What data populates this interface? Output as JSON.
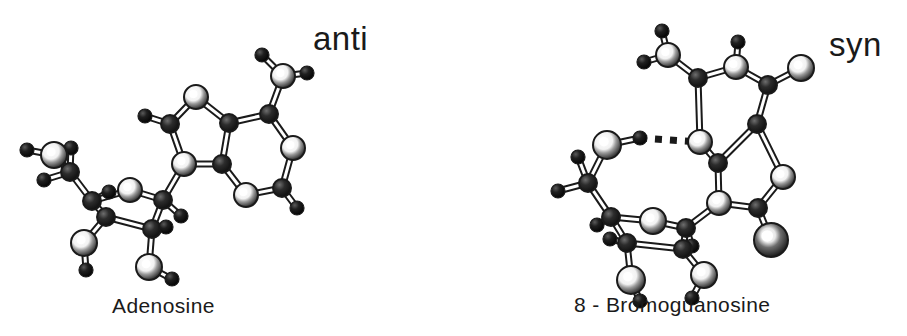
{
  "figure": {
    "background_color": "#ffffff",
    "ink_color": "#1a1a1a",
    "width": 907,
    "height": 336,
    "caption_font_size": 21,
    "label_font_size": 33
  },
  "panels": [
    {
      "id": "left-panel",
      "molecule_name": "Adenosine",
      "conformation_label": "anti",
      "has_hydrogen_bond": false
    },
    {
      "id": "right-panel",
      "molecule_name": "8 - Bromoguanosine",
      "conformation_label": "syn",
      "has_hydrogen_bond": true
    }
  ],
  "structures": {
    "adenosine": {
      "atoms": [
        {
          "id": "N6H_a",
          "x": 262,
          "y": 55,
          "r": 7,
          "type": "small"
        },
        {
          "id": "N6",
          "x": 283,
          "y": 76,
          "r": 12,
          "type": "large"
        },
        {
          "id": "N6H_b",
          "x": 307,
          "y": 73,
          "r": 7,
          "type": "small"
        },
        {
          "id": "C6",
          "x": 269,
          "y": 114,
          "r": 9,
          "type": "medium"
        },
        {
          "id": "N1",
          "x": 293,
          "y": 148,
          "r": 12,
          "type": "large"
        },
        {
          "id": "C2",
          "x": 282,
          "y": 188,
          "r": 9,
          "type": "medium"
        },
        {
          "id": "C2H",
          "x": 297,
          "y": 208,
          "r": 7,
          "type": "small"
        },
        {
          "id": "N3",
          "x": 246,
          "y": 195,
          "r": 12,
          "type": "large"
        },
        {
          "id": "C4",
          "x": 222,
          "y": 164,
          "r": 9,
          "type": "medium"
        },
        {
          "id": "C5",
          "x": 229,
          "y": 123,
          "r": 9,
          "type": "medium"
        },
        {
          "id": "N7",
          "x": 196,
          "y": 97,
          "r": 12,
          "type": "large"
        },
        {
          "id": "C8",
          "x": 170,
          "y": 124,
          "r": 9,
          "type": "medium"
        },
        {
          "id": "C8H",
          "x": 145,
          "y": 116,
          "r": 7,
          "type": "small"
        },
        {
          "id": "N9",
          "x": 184,
          "y": 164,
          "r": 12,
          "type": "large"
        },
        {
          "id": "C1p",
          "x": 163,
          "y": 200,
          "r": 9,
          "type": "medium"
        },
        {
          "id": "C1pH",
          "x": 181,
          "y": 216,
          "r": 7,
          "type": "small"
        },
        {
          "id": "O4p",
          "x": 130,
          "y": 190,
          "r": 12,
          "type": "large"
        },
        {
          "id": "C2p",
          "x": 152,
          "y": 229,
          "r": 9,
          "type": "medium"
        },
        {
          "id": "C2pH",
          "x": 166,
          "y": 227,
          "r": 7,
          "type": "small"
        },
        {
          "id": "O2p",
          "x": 149,
          "y": 267,
          "r": 13,
          "type": "large"
        },
        {
          "id": "HO2p",
          "x": 172,
          "y": 279,
          "r": 7,
          "type": "small"
        },
        {
          "id": "C3p",
          "x": 106,
          "y": 217,
          "r": 9,
          "type": "medium"
        },
        {
          "id": "O3p",
          "x": 84,
          "y": 243,
          "r": 13,
          "type": "large"
        },
        {
          "id": "HO3p",
          "x": 86,
          "y": 270,
          "r": 7,
          "type": "small"
        },
        {
          "id": "C4p",
          "x": 92,
          "y": 201,
          "r": 9,
          "type": "medium"
        },
        {
          "id": "C4pH",
          "x": 109,
          "y": 192,
          "r": 7,
          "type": "small"
        },
        {
          "id": "C5p",
          "x": 70,
          "y": 172,
          "r": 9,
          "type": "medium"
        },
        {
          "id": "C5pHa",
          "x": 71,
          "y": 148,
          "r": 7,
          "type": "small"
        },
        {
          "id": "C5pHb",
          "x": 44,
          "y": 180,
          "r": 7,
          "type": "small"
        },
        {
          "id": "O5p",
          "x": 54,
          "y": 155,
          "r": 13,
          "type": "large"
        },
        {
          "id": "HO5p",
          "x": 27,
          "y": 150,
          "r": 7,
          "type": "small"
        }
      ],
      "bonds": [
        [
          "N6H_a",
          "N6"
        ],
        [
          "N6",
          "N6H_b"
        ],
        [
          "N6",
          "C6"
        ],
        [
          "C6",
          "N1"
        ],
        [
          "N1",
          "C2"
        ],
        [
          "C2",
          "C2H"
        ],
        [
          "C2",
          "N3"
        ],
        [
          "N3",
          "C4"
        ],
        [
          "C4",
          "C5"
        ],
        [
          "C5",
          "C6"
        ],
        [
          "C5",
          "N7"
        ],
        [
          "N7",
          "C8"
        ],
        [
          "C8",
          "C8H"
        ],
        [
          "C8",
          "N9"
        ],
        [
          "N9",
          "C4"
        ],
        [
          "N9",
          "C1p"
        ],
        [
          "C1p",
          "C1pH"
        ],
        [
          "C1p",
          "O4p"
        ],
        [
          "C1p",
          "C2p"
        ],
        [
          "C2p",
          "C2pH"
        ],
        [
          "C2p",
          "O2p"
        ],
        [
          "O2p",
          "HO2p"
        ],
        [
          "C2p",
          "C3p"
        ],
        [
          "C3p",
          "O3p"
        ],
        [
          "O3p",
          "HO3p"
        ],
        [
          "C3p",
          "C4p"
        ],
        [
          "C4p",
          "C4pH"
        ],
        [
          "C4p",
          "O4p"
        ],
        [
          "C4p",
          "C5p"
        ],
        [
          "C5p",
          "C5pHa"
        ],
        [
          "C5p",
          "C5pHb"
        ],
        [
          "C5p",
          "O5p"
        ],
        [
          "O5p",
          "HO5p"
        ]
      ]
    },
    "bromoguanosine": {
      "atoms": [
        {
          "id": "O6",
          "x": 662,
          "y": 31,
          "r": 7,
          "type": "small"
        },
        {
          "id": "C6",
          "x": 668,
          "y": 55,
          "r": 12,
          "type": "large"
        },
        {
          "id": "N1H",
          "x": 644,
          "y": 62,
          "r": 7,
          "type": "small"
        },
        {
          "id": "N1",
          "x": 698,
          "y": 78,
          "r": 9,
          "type": "medium"
        },
        {
          "id": "C2",
          "x": 736,
          "y": 67,
          "r": 12,
          "type": "large"
        },
        {
          "id": "N2H",
          "x": 738,
          "y": 42,
          "r": 7,
          "type": "small"
        },
        {
          "id": "N2",
          "x": 768,
          "y": 85,
          "r": 9,
          "type": "medium"
        },
        {
          "id": "NH2",
          "x": 801,
          "y": 68,
          "r": 13,
          "type": "large"
        },
        {
          "id": "C5",
          "x": 757,
          "y": 124,
          "r": 9,
          "type": "medium"
        },
        {
          "id": "N3",
          "x": 700,
          "y": 142,
          "r": 12,
          "type": "large"
        },
        {
          "id": "C4",
          "x": 718,
          "y": 163,
          "r": 9,
          "type": "medium"
        },
        {
          "id": "N7",
          "x": 783,
          "y": 177,
          "r": 12,
          "type": "large"
        },
        {
          "id": "C8",
          "x": 758,
          "y": 208,
          "r": 9,
          "type": "medium"
        },
        {
          "id": "Br",
          "x": 771,
          "y": 240,
          "r": 17,
          "type": "xlarge"
        },
        {
          "id": "N9",
          "x": 719,
          "y": 203,
          "r": 12,
          "type": "large"
        },
        {
          "id": "C1p",
          "x": 686,
          "y": 228,
          "r": 9,
          "type": "medium"
        },
        {
          "id": "C1pH",
          "x": 692,
          "y": 246,
          "r": 7,
          "type": "small"
        },
        {
          "id": "O4p",
          "x": 653,
          "y": 221,
          "r": 13,
          "type": "large"
        },
        {
          "id": "C2p",
          "x": 683,
          "y": 249,
          "r": 9,
          "type": "medium"
        },
        {
          "id": "O2p",
          "x": 704,
          "y": 275,
          "r": 13,
          "type": "large"
        },
        {
          "id": "HO2p",
          "x": 692,
          "y": 298,
          "r": 7,
          "type": "small"
        },
        {
          "id": "C3p",
          "x": 627,
          "y": 243,
          "r": 9,
          "type": "medium"
        },
        {
          "id": "C3pH",
          "x": 610,
          "y": 239,
          "r": 7,
          "type": "small"
        },
        {
          "id": "O3p",
          "x": 631,
          "y": 280,
          "r": 14,
          "type": "large"
        },
        {
          "id": "HO3p",
          "x": 640,
          "y": 301,
          "r": 7,
          "type": "small"
        },
        {
          "id": "C4p",
          "x": 611,
          "y": 217,
          "r": 9,
          "type": "medium"
        },
        {
          "id": "C4pH",
          "x": 597,
          "y": 225,
          "r": 7,
          "type": "small"
        },
        {
          "id": "C5p",
          "x": 588,
          "y": 183,
          "r": 9,
          "type": "medium"
        },
        {
          "id": "C5pHa",
          "x": 578,
          "y": 157,
          "r": 7,
          "type": "small"
        },
        {
          "id": "C5pHb",
          "x": 558,
          "y": 191,
          "r": 7,
          "type": "small"
        },
        {
          "id": "O5p",
          "x": 607,
          "y": 145,
          "r": 14,
          "type": "large"
        },
        {
          "id": "HO5p",
          "x": 640,
          "y": 138,
          "r": 7,
          "type": "small"
        }
      ],
      "bonds": [
        [
          "O6",
          "C6"
        ],
        [
          "C6",
          "N1H"
        ],
        [
          "C6",
          "N1"
        ],
        [
          "N1",
          "C2"
        ],
        [
          "C2",
          "N2H"
        ],
        [
          "C2",
          "N2"
        ],
        [
          "N2",
          "NH2"
        ],
        [
          "N2",
          "C5"
        ],
        [
          "C5",
          "C4"
        ],
        [
          "C4",
          "N3"
        ],
        [
          "N3",
          "N1"
        ],
        [
          "C5",
          "N7"
        ],
        [
          "N7",
          "C8"
        ],
        [
          "C8",
          "Br"
        ],
        [
          "C8",
          "N9"
        ],
        [
          "N9",
          "C4"
        ],
        [
          "N9",
          "C1p"
        ],
        [
          "C1p",
          "C1pH"
        ],
        [
          "C1p",
          "O4p"
        ],
        [
          "C1p",
          "C2p"
        ],
        [
          "C2p",
          "O2p"
        ],
        [
          "O2p",
          "HO2p"
        ],
        [
          "C2p",
          "C3p"
        ],
        [
          "C3p",
          "C3pH"
        ],
        [
          "C3p",
          "O3p"
        ],
        [
          "O3p",
          "HO3p"
        ],
        [
          "C3p",
          "C4p"
        ],
        [
          "C4p",
          "C4pH"
        ],
        [
          "C4p",
          "O4p"
        ],
        [
          "C4p",
          "C5p"
        ],
        [
          "C5p",
          "C5pHa"
        ],
        [
          "C5p",
          "C5pHb"
        ],
        [
          "C5p",
          "O5p"
        ],
        [
          "O5p",
          "HO5p"
        ]
      ],
      "hydrogen_bond": {
        "from": "HO5p",
        "to": "N3",
        "style": "dotted"
      }
    }
  }
}
